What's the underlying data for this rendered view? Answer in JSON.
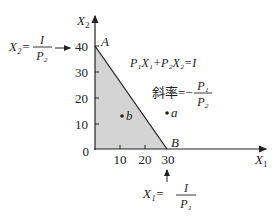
{
  "axes": {
    "y_label": "X",
    "y_sub": "2",
    "x_label": "X",
    "x_sub": "1",
    "origin": "0",
    "y_ticks": [
      "10",
      "20",
      "30",
      "40"
    ],
    "x_ticks": [
      "10",
      "20",
      "30"
    ]
  },
  "points": {
    "A": "A",
    "B": "B",
    "a": "a",
    "b": "b"
  },
  "equation": {
    "text": "P₁X₁+P₂X₂=I"
  },
  "slope": {
    "label": "斜率=−",
    "num": "P₁",
    "den": "P₂"
  },
  "y_intercept": {
    "lhs": "X₂=",
    "num": "I",
    "den": "P₂"
  },
  "x_intercept": {
    "lhs": "X₁=",
    "num": "I",
    "den": "P₁"
  },
  "colors": {
    "shade": "#d4d4d4",
    "line": "#222222"
  }
}
